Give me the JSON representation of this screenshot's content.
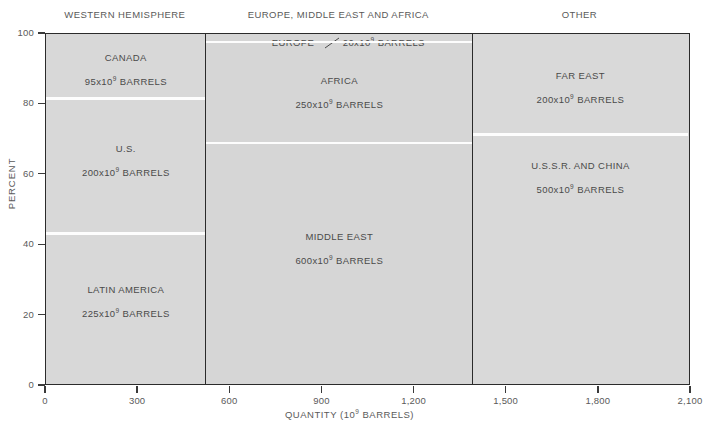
{
  "chart_data": {
    "type": "bar",
    "subtype": "mosaic",
    "title": "",
    "xlabel": "QUANTITY (10⁹ BARRELS)",
    "ylabel": "PERCENT",
    "xlim": [
      0,
      2100
    ],
    "ylim": [
      0,
      100
    ],
    "xticks": [
      0,
      300,
      600,
      900,
      1200,
      1500,
      1800,
      2100
    ],
    "xtick_labels": [
      "0",
      "300",
      "600",
      "900",
      "1,200",
      "1,500",
      "1,800",
      "2,100"
    ],
    "yticks": [
      0,
      20,
      40,
      60,
      80,
      100
    ],
    "ytick_labels": [
      "0",
      "20",
      "40",
      "60",
      "80",
      "100"
    ],
    "grid": false,
    "legend": "none",
    "units": "10⁹ BARRELS",
    "groups": [
      {
        "header": "WESTERN HEMISPHERE",
        "x_start": 0,
        "x_end": 520,
        "width": 520,
        "segments": [
          {
            "name": "CANADA",
            "value": 95,
            "value_label": "95",
            "unit_prefix": "x10",
            "unit_exp": "9",
            "unit_suffix": " BARRELS",
            "pct_start": 81.7,
            "pct_end": 100.0
          },
          {
            "name": "U.S.",
            "value": 200,
            "value_label": "200",
            "unit_prefix": "x10",
            "unit_exp": "9",
            "unit_suffix": " BARRELS",
            "pct_start": 43.3,
            "pct_end": 81.7
          },
          {
            "name": "LATIN AMERICA",
            "value": 225,
            "value_label": "225",
            "unit_prefix": "x10",
            "unit_exp": "9",
            "unit_suffix": " BARRELS",
            "pct_start": 0.0,
            "pct_end": 43.3
          }
        ]
      },
      {
        "header": "EUROPE, MIDDLE EAST AND AFRICA",
        "x_start": 520,
        "x_end": 1390,
        "width": 870,
        "segments": [
          {
            "name": "EUROPE",
            "value": 20,
            "value_label": "20",
            "unit_prefix": "x10",
            "unit_exp": "9",
            "unit_suffix": " BARRELS",
            "pct_start": 97.7,
            "pct_end": 100.0,
            "callout": true
          },
          {
            "name": "AFRICA",
            "value": 250,
            "value_label": "250",
            "unit_prefix": "x10",
            "unit_exp": "9",
            "unit_suffix": " BARRELS",
            "pct_start": 69.0,
            "pct_end": 97.7
          },
          {
            "name": "MIDDLE EAST",
            "value": 600,
            "value_label": "600",
            "unit_prefix": "x10",
            "unit_exp": "9",
            "unit_suffix": " BARRELS",
            "pct_start": 0.0,
            "pct_end": 69.0
          }
        ]
      },
      {
        "header": "OTHER",
        "x_start": 1390,
        "x_end": 2090,
        "width": 700,
        "segments": [
          {
            "name": "FAR EAST",
            "value": 200,
            "value_label": "200",
            "unit_prefix": "x10",
            "unit_exp": "9",
            "unit_suffix": " BARRELS",
            "pct_start": 71.4,
            "pct_end": 100.0
          },
          {
            "name": "U.S.S.R. AND CHINA",
            "value": 500,
            "value_label": "500",
            "unit_prefix": "x10",
            "unit_exp": "9",
            "unit_suffix": " BARRELS",
            "pct_start": 0.0,
            "pct_end": 71.4
          }
        ]
      }
    ]
  },
  "colors": {
    "plot_fill": "#d8d8d8",
    "frame": "#2b2b2b",
    "segment_rule": "#fdfdfd",
    "text": "#4a4a4a",
    "axis_text": "#5a5a5a",
    "background": "#ffffff"
  }
}
